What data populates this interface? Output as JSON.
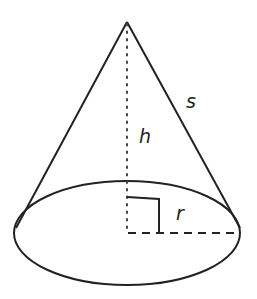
{
  "diagram": {
    "colors": {
      "stroke": "#222222",
      "background": "#ffffff"
    },
    "labels": {
      "height": "h",
      "slant_height": "s",
      "radius": "r"
    },
    "geometry": {
      "apex": [
        127,
        22
      ],
      "base_center": [
        127,
        233
      ],
      "base_rx": 113,
      "base_ry": 52,
      "left_tangent": [
        16,
        228
      ],
      "right_tangent": [
        240,
        228
      ],
      "right_angle_marker_size": 32
    }
  }
}
